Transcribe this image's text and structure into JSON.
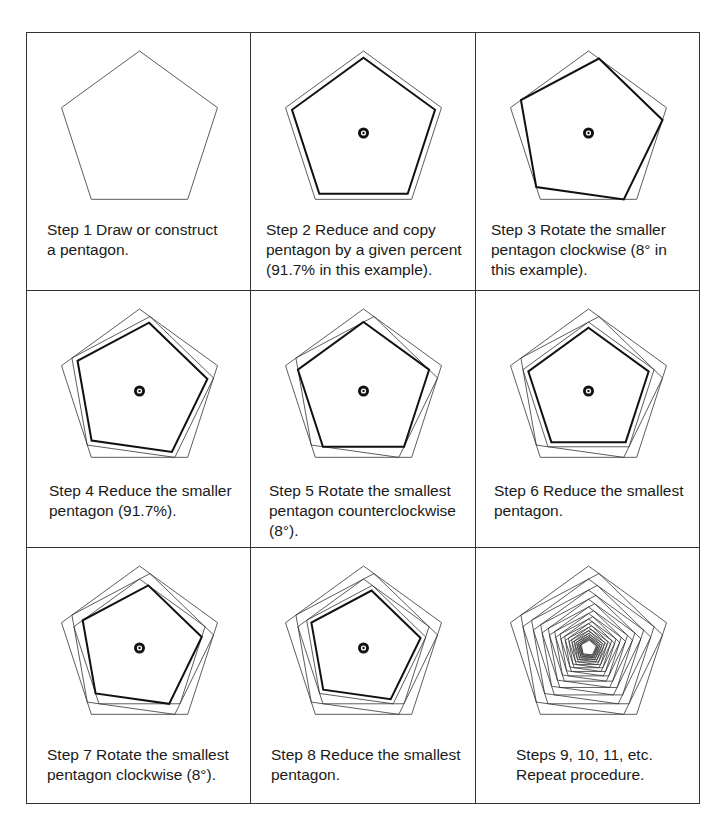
{
  "figure": {
    "scale_factor": 0.917,
    "rotation_degrees": 8,
    "line_color": "#333333",
    "bold_color": "#111111",
    "marker_color": "#111111"
  },
  "steps": [
    {
      "caption": "Step 1  Draw or construct\na pentagon.",
      "polys": [
        [
          1,
          0,
          0
        ]
      ],
      "marker": false
    },
    {
      "caption": "Step 2  Reduce and copy\npentagon by a given percent\n(91.7% in this example).",
      "polys": [
        [
          1,
          0,
          0
        ],
        [
          0.917,
          0,
          1
        ]
      ],
      "marker": true
    },
    {
      "caption": "Step 3  Rotate the smaller\npentagon clockwise (8° in\nthis example).",
      "polys": [
        [
          1,
          0,
          0
        ],
        [
          0.917,
          8,
          1
        ]
      ],
      "marker": true
    },
    {
      "caption": "Step 4  Reduce the smaller\npentagon (91.7%).",
      "polys": [
        [
          1,
          0,
          0
        ],
        [
          0.917,
          8,
          0
        ],
        [
          0.841,
          8,
          1
        ]
      ],
      "marker": true
    },
    {
      "caption": "Step 5  Rotate the smallest\npentagon counterclockwise\n(8°).",
      "polys": [
        [
          1,
          0,
          0
        ],
        [
          0.917,
          8,
          0
        ],
        [
          0.841,
          0,
          1
        ]
      ],
      "marker": true
    },
    {
      "caption": "Step 6  Reduce the smallest\npentagon.",
      "polys": [
        [
          1,
          0,
          0
        ],
        [
          0.917,
          8,
          0
        ],
        [
          0.841,
          0,
          0
        ],
        [
          0.771,
          0,
          1
        ]
      ],
      "marker": true
    },
    {
      "caption": "Step 7  Rotate the smallest\npentagon clockwise (8°).",
      "polys": [
        [
          1,
          0,
          0
        ],
        [
          0.917,
          8,
          0
        ],
        [
          0.841,
          0,
          0
        ],
        [
          0.771,
          8,
          1
        ]
      ],
      "marker": true
    },
    {
      "caption": "Step 8  Reduce the smallest\npentagon.",
      "polys": [
        [
          1,
          0,
          0
        ],
        [
          0.917,
          8,
          0
        ],
        [
          0.841,
          0,
          0
        ],
        [
          0.771,
          8,
          0
        ],
        [
          0.707,
          8,
          1
        ]
      ],
      "marker": true
    },
    {
      "caption": "Steps 9, 10, 11, etc.\nRepeat procedure.",
      "polys": "repeat",
      "iterations": 28,
      "marker": false
    }
  ]
}
